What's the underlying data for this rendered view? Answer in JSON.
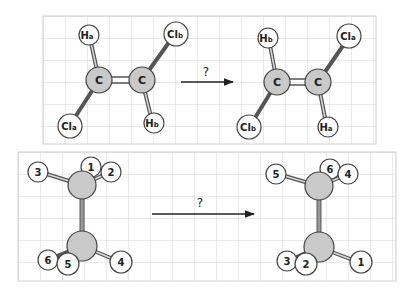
{
  "diagram": {
    "top_panel": {
      "description": "cis/trans isomer relabeling of dichloroethene",
      "arrow_label": "?",
      "left_molecule": {
        "atoms": [
          {
            "id": "C1",
            "label": "C",
            "sub": ""
          },
          {
            "id": "C2",
            "label": "C",
            "sub": ""
          },
          {
            "id": "Ha",
            "label": "H",
            "sub": "a"
          },
          {
            "id": "Cla",
            "label": "Cl",
            "sub": "a"
          },
          {
            "id": "Clb",
            "label": "Cl",
            "sub": "b"
          },
          {
            "id": "Hb",
            "label": "H",
            "sub": "b"
          }
        ]
      },
      "right_molecule": {
        "atoms": [
          {
            "id": "C1",
            "label": "C",
            "sub": ""
          },
          {
            "id": "C2",
            "label": "C",
            "sub": ""
          },
          {
            "id": "Hb",
            "label": "H",
            "sub": "b"
          },
          {
            "id": "Clb",
            "label": "Cl",
            "sub": "b"
          },
          {
            "id": "Cla",
            "label": "Cl",
            "sub": "a"
          },
          {
            "id": "Ha",
            "label": "H",
            "sub": "a"
          }
        ]
      }
    },
    "bottom_panel": {
      "description": "ethane hydrogen relabeling",
      "arrow_label": "?",
      "left_molecule": {
        "hydrogens_top": [
          "1",
          "2",
          "3"
        ],
        "hydrogens_bottom": [
          "4",
          "5",
          "6"
        ]
      },
      "right_molecule": {
        "hydrogens_top": [
          "6",
          "4",
          "5"
        ],
        "hydrogens_bottom": [
          "1",
          "2",
          "3"
        ]
      }
    }
  }
}
